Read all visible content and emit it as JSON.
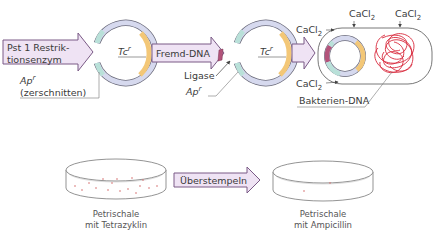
{
  "diagram": {
    "step1": {
      "arrow_label_line1": "Pst 1 Restrik-",
      "arrow_label_line2": "tionsenzym",
      "plasmid_marker_tc": "Tc",
      "plasmid_marker_tc_sup": "r",
      "ap_label": "Ap",
      "ap_label_sup": "r",
      "ap_note": "(zerschnitten)"
    },
    "step2": {
      "arrow_label": "Fremd-DNA",
      "ligase_label": "Ligase",
      "ap_label": "Ap",
      "ap_label_sup": "r",
      "plasmid_marker_tc": "Tc",
      "plasmid_marker_tc_sup": "r"
    },
    "step3": {
      "cacl2_label": "CaCl",
      "cacl2_sub": "2",
      "bacteria_dna_label": "Bakterien-DNA"
    },
    "step4": {
      "dish1_caption_line1": "Petrischale",
      "dish1_caption_line2": "mit Tetrazyklin",
      "arrow_label": "Überstempeln",
      "dish2_caption_line1": "Petrischale",
      "dish2_caption_line2": "mit Ampicillin"
    },
    "colors": {
      "arrow_fill": "#efe3f4",
      "arrow_stroke": "#7a5a86",
      "plasmid_main": "#d6d9ee",
      "plasmid_tc_segment": "#f3c777",
      "plasmid_ap_segment": "#b9e1d9",
      "foreign_dna": "#b3537a",
      "bacteria_dna": "#d8283b",
      "outline": "#555555"
    }
  }
}
